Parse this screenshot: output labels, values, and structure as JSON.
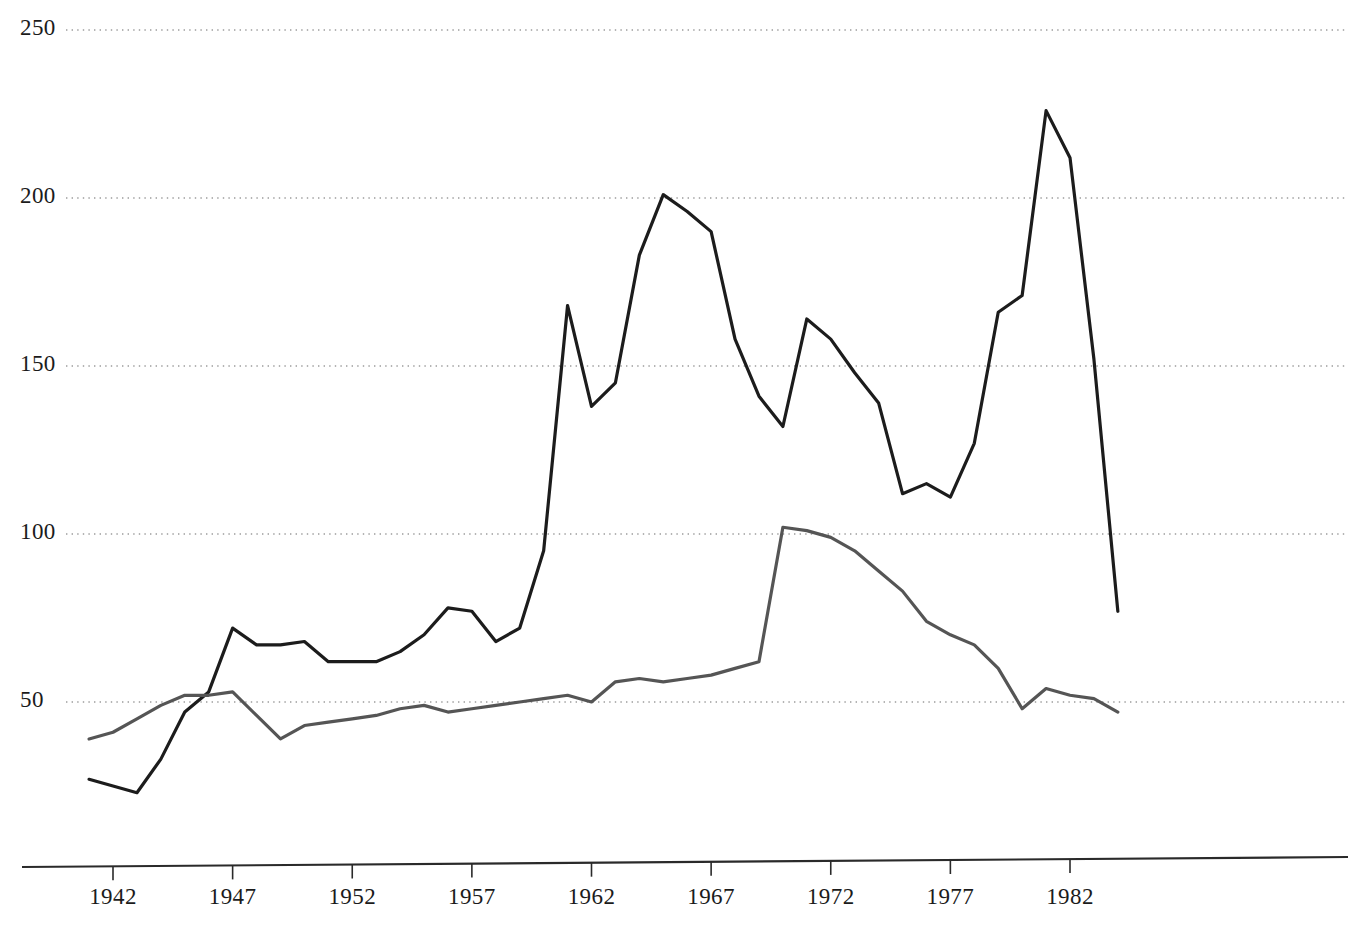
{
  "chart_data": {
    "type": "line",
    "title": "",
    "subtitle": "",
    "xlabel": "",
    "ylabel": "",
    "xlim": [
      1941,
      1985
    ],
    "ylim": [
      0,
      250
    ],
    "grid": true,
    "grid_axis": "y",
    "grid_style": "dotted",
    "legend": "none",
    "y_ticks": [
      50,
      100,
      150,
      200,
      250
    ],
    "y_tick_labels": [
      "50",
      "100",
      "150",
      "200",
      "250"
    ],
    "x_ticks": [
      1942,
      1947,
      1952,
      1957,
      1962,
      1967,
      1972,
      1977,
      1982
    ],
    "x_tick_labels": [
      "1942",
      "1947",
      "1952",
      "1957",
      "1962",
      "1967",
      "1972",
      "1977",
      "1982"
    ],
    "x": [
      1941,
      1942,
      1943,
      1944,
      1945,
      1946,
      1947,
      1948,
      1949,
      1950,
      1951,
      1952,
      1953,
      1954,
      1955,
      1956,
      1957,
      1958,
      1959,
      1960,
      1961,
      1962,
      1963,
      1964,
      1965,
      1966,
      1967,
      1968,
      1969,
      1970,
      1971,
      1972,
      1973,
      1974,
      1975,
      1976,
      1977,
      1978,
      1979,
      1980,
      1981,
      1982,
      1983,
      1984
    ],
    "series": [
      {
        "name": "series-dark",
        "color": "#1c1c1c",
        "width": 3.2,
        "values": [
          27,
          25,
          23,
          33,
          47,
          53,
          72,
          67,
          67,
          68,
          62,
          62,
          62,
          65,
          70,
          78,
          77,
          68,
          72,
          95,
          168,
          138,
          145,
          183,
          201,
          196,
          190,
          158,
          141,
          132,
          164,
          158,
          148,
          139,
          112,
          115,
          111,
          127,
          166,
          171,
          226,
          212,
          152,
          77
        ]
      },
      {
        "name": "series-gray",
        "color": "#555555",
        "width": 3.2,
        "values": [
          39,
          41,
          45,
          49,
          52,
          52,
          53,
          46,
          39,
          43,
          44,
          45,
          46,
          48,
          49,
          47,
          48,
          49,
          50,
          51,
          52,
          50,
          56,
          57,
          56,
          57,
          58,
          60,
          62,
          102,
          101,
          99,
          95,
          89,
          83,
          74,
          70,
          67,
          60,
          48,
          54,
          52,
          51,
          47
        ]
      }
    ]
  },
  "axis": {
    "x_axis_line": "tapered-horizontal-rule",
    "tick_marks": "below-axis"
  }
}
